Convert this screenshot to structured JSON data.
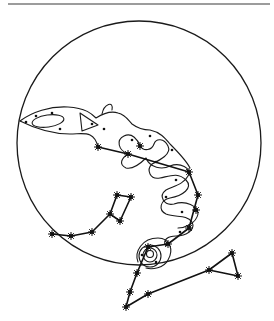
{
  "figure": {
    "colors": {
      "ink": "#111111",
      "background": "#ffffff"
    },
    "circle": {
      "cx": 139,
      "cy": 143,
      "r": 122
    },
    "rule": {
      "x1": 8,
      "x2": 270,
      "y": 4
    },
    "constellations": [
      {
        "name": "draco",
        "stars": [
          [
            98,
            147
          ],
          [
            128,
            154
          ],
          [
            140,
            146
          ],
          [
            189,
            172
          ],
          [
            198,
            195
          ],
          [
            196,
            210
          ],
          [
            189,
            228
          ],
          [
            168,
            244
          ],
          [
            148,
            247
          ],
          [
            137,
            273
          ],
          [
            130,
            292
          ],
          [
            126,
            307
          ],
          [
            148,
            294
          ],
          [
            209,
            270
          ],
          [
            238,
            276
          ],
          [
            232,
            253
          ]
        ],
        "path": [
          [
            98,
            147
          ],
          [
            128,
            154
          ],
          [
            189,
            172
          ],
          [
            198,
            195
          ],
          [
            189,
            228
          ],
          [
            168,
            244
          ],
          [
            148,
            247
          ],
          [
            137,
            273
          ],
          [
            130,
            292
          ],
          [
            126,
            307
          ],
          [
            148,
            294
          ],
          [
            209,
            270
          ],
          [
            238,
            276
          ],
          [
            232,
            253
          ],
          [
            209,
            270
          ]
        ]
      },
      {
        "name": "lower-left",
        "stars": [
          [
            52,
            234
          ],
          [
            71,
            236
          ],
          [
            92,
            232
          ],
          [
            110,
            214
          ],
          [
            117,
            195
          ],
          [
            131,
            197
          ],
          [
            120,
            221
          ]
        ],
        "path": [
          [
            52,
            234
          ],
          [
            71,
            236
          ],
          [
            92,
            232
          ],
          [
            110,
            214
          ],
          [
            117,
            195
          ],
          [
            131,
            197
          ],
          [
            120,
            221
          ],
          [
            110,
            214
          ]
        ]
      }
    ]
  }
}
